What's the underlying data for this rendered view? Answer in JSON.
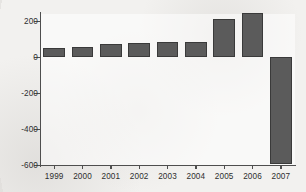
{
  "chart_data": {
    "type": "bar",
    "title": "",
    "subtitle": "",
    "xlabel": "",
    "ylabel": "",
    "categories": [
      "1999",
      "2000",
      "2001",
      "2002",
      "2003",
      "2004",
      "2005",
      "2006",
      "2007"
    ],
    "values": [
      50,
      57,
      72,
      80,
      85,
      85,
      211,
      245,
      -595
    ],
    "series": [
      {
        "name": "",
        "values": [
          50,
          57,
          72,
          80,
          85,
          85,
          211,
          245,
          -595
        ]
      }
    ],
    "ylim": [
      -620,
      280
    ],
    "yticks": [
      200,
      0,
      -200,
      -400,
      -600
    ],
    "ytick_labels": [
      "200",
      "0",
      "-200",
      "-400",
      "-600"
    ],
    "xtick_labels": [
      "1999",
      "2000",
      "2001",
      "2002",
      "2003",
      "2004",
      "2005",
      "2006",
      "2007"
    ],
    "grid": false,
    "legend": false,
    "legend_position": "none",
    "bar_color": "#5b5b5b",
    "bar_edge_color": "#3a3a3a",
    "axis_color": "#4e4e4e",
    "background_color": "#f2f1ef",
    "plot_background_color": "#fdfdfd",
    "annotations": []
  }
}
